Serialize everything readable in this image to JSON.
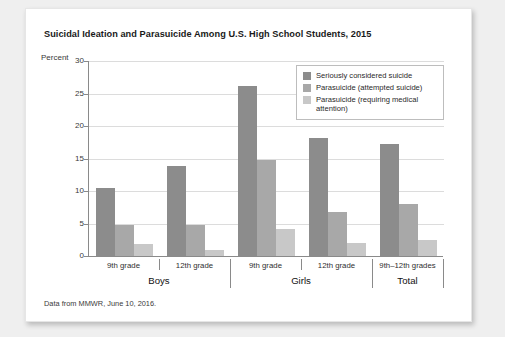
{
  "figure": {
    "title": "Suicidal Ideation and Parasuicide Among U.S. High School Students, 2015",
    "source_note": "Data from MMWR, June 10, 2016.",
    "y_axis_caption": "Percent"
  },
  "chart_data": {
    "type": "bar",
    "title": "Suicidal Ideation and Parasuicide Among U.S. High School Students, 2015",
    "xlabel": "",
    "ylabel": "Percent",
    "ylim": [
      0,
      30
    ],
    "yticks": [
      0,
      5,
      10,
      15,
      20,
      25,
      30
    ],
    "grid": true,
    "legend_position": "top-right",
    "categories": [
      "9th grade",
      "12th grade",
      "9th grade",
      "12th grade",
      "9th–12th grades"
    ],
    "groups": [
      {
        "name": "Boys",
        "subcategories": [
          "9th grade",
          "12th grade"
        ]
      },
      {
        "name": "Girls",
        "subcategories": [
          "9th grade",
          "12th grade"
        ]
      },
      {
        "name": "Total",
        "subcategories": [
          "9th–12th grades"
        ]
      }
    ],
    "series": [
      {
        "name": "Seriously considered suicide",
        "color": "#8c8c8c",
        "values": [
          10.5,
          13.8,
          26.2,
          18.1,
          17.2
        ]
      },
      {
        "name": "Parasuicide (attempted suicide)",
        "color": "#a8a8a8",
        "values": [
          4.8,
          4.8,
          14.7,
          6.7,
          8.0
        ]
      },
      {
        "name": "Parasuicide (requiring medical attention)",
        "color": "#c8c8c8",
        "values": [
          1.8,
          1.0,
          4.2,
          2.0,
          2.4
        ]
      }
    ]
  }
}
